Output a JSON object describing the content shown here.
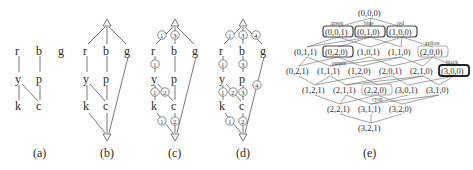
{
  "figure": {
    "panels": [
      {
        "id": "a",
        "caption": "(a)",
        "nodes": [
          "r",
          "b",
          "g",
          "y",
          "p",
          "k",
          "c"
        ],
        "edges": [
          [
            "r",
            "y"
          ],
          [
            "b",
            "p"
          ],
          [
            "y",
            "k"
          ],
          [
            "y",
            "c"
          ],
          [
            "p",
            "c"
          ]
        ]
      },
      {
        "id": "b",
        "caption": "(b)",
        "top": "△",
        "bottom": "▽",
        "nodes": [
          "r",
          "b",
          "g",
          "y",
          "p",
          "k",
          "c"
        ]
      },
      {
        "id": "c",
        "caption": "(c)",
        "top": "△",
        "bottom": "▽",
        "nodes": [
          "r",
          "b",
          "g",
          "y",
          "p",
          "k",
          "c"
        ],
        "weights": {
          "top_r": "1",
          "top_b": "3",
          "r_y": "1",
          "y_k": "1",
          "y_c": "2",
          "k_bot": "1",
          "c_bot": "2"
        }
      },
      {
        "id": "d",
        "caption": "(d)",
        "top": "△",
        "bottom": "▽",
        "nodes": [
          "r",
          "b",
          "g",
          "y",
          "p",
          "k",
          "c"
        ],
        "weights": {
          "top_r": "1",
          "top_b": "3",
          "top_g": "4",
          "r_y": "1",
          "b_p": "3",
          "y_k": "1",
          "y_c": "2",
          "p_c": "3",
          "g_bot": "4",
          "k_bot": "1",
          "c_bot": "2"
        }
      },
      {
        "id": "e",
        "caption": "(e)",
        "levels": [
          [
            "(0,0,0)"
          ],
          [
            "(0,0,1)",
            "(0,1,0)",
            "(1,0,0)"
          ],
          [
            "(0,1,1)",
            "(0,2,0)",
            "(1,0,1)",
            "(1,1,0)",
            "(2,0,0)"
          ],
          [
            "(0,2,1)",
            "(1,1,1)",
            "(1,2,0)",
            "(2,0,1)",
            "(2,1,0)",
            "(3,0,0)"
          ],
          [
            "(1,2,1)",
            "(2,1,1)",
            "(2,2,0)",
            "(3,0,1)",
            "(3,1,0)"
          ],
          [
            "(2,2,1)",
            "(3,1,1)",
            "(3,2,0)"
          ],
          [
            "(3,2,1)"
          ]
        ],
        "color_labels": {
          "green": "green",
          "blue": "blue",
          "red": "red",
          "yellow": "yellow",
          "purple": "purple",
          "black": "black",
          "cyan": "cyan"
        }
      }
    ]
  }
}
